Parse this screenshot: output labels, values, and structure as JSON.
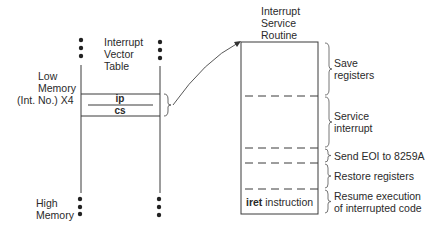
{
  "ivt": {
    "title_line1": "Interrupt",
    "title_line2": "Vector",
    "title_line3": "Table",
    "low_memory_line1": "Low",
    "low_memory_line2": "Memory",
    "int_no_label": "(Int. No.) X4",
    "ip_label": "ip",
    "cs_label": "cs",
    "high_memory_line1": "High",
    "high_memory_line2": "Memory"
  },
  "isr": {
    "title_line1": "Interrupt",
    "title_line2": "Service",
    "title_line3": "Routine",
    "iret_keyword": "iret",
    "iret_rest": " instruction",
    "steps": [
      {
        "line1": "Save",
        "line2": "registers"
      },
      {
        "line1": "Service",
        "line2": "interrupt"
      },
      {
        "line1": "Send EOI to 8259A",
        "line2": ""
      },
      {
        "line1": "Restore registers",
        "line2": ""
      },
      {
        "line1": "Resume execution",
        "line2": "of interrupted code"
      }
    ]
  },
  "colors": {
    "line": "#3a3a3a",
    "text": "#2a2a2a",
    "background": "#ffffff"
  }
}
